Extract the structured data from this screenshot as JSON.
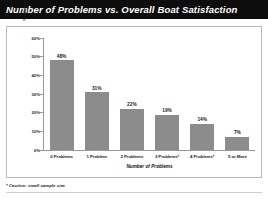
{
  "title": "Number of Problems vs. Overall Boat Satisfaction",
  "footnote": "* Caution: small sample size",
  "colors": {
    "banner": "#0d0d0d",
    "bar": "#8c8c8c",
    "axis": "#9a9a9a",
    "frame": "#b9b9b9",
    "text": "#1a1a1a"
  },
  "chart_data": {
    "type": "bar",
    "title": "Number of Problems vs. Overall Boat Satisfaction",
    "categories": [
      "0 Problems",
      "1 Problem",
      "2 Problems",
      "3 Problems*",
      "4 Problems*",
      "5 or More"
    ],
    "values": [
      48,
      31,
      22,
      19,
      14,
      7
    ],
    "value_labels": [
      "48%",
      "31%",
      "22%",
      "19%",
      "14%",
      "7%"
    ],
    "xlabel": "Number of Problems",
    "ylabel": "% achieving 10 for Overall Satisfaction",
    "ylim": [
      0,
      60
    ],
    "yticks": [
      60,
      50,
      40,
      30,
      20,
      10,
      0
    ],
    "ytick_labels": [
      "60%",
      "50%",
      "40%",
      "30%",
      "20%",
      "10%",
      "0%"
    ],
    "grid": false,
    "legend": false
  }
}
